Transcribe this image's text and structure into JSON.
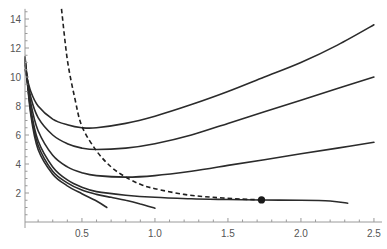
{
  "chart_data": {
    "type": "line",
    "title": "",
    "xlabel": "",
    "ylabel": "",
    "xlim": [
      0.11,
      2.55
    ],
    "ylim": [
      0,
      14.7
    ],
    "grid": false,
    "legend": null,
    "x_ticks": [
      0.5,
      1.0,
      1.5,
      2.0,
      2.5
    ],
    "x_tick_labels": [
      "0.5",
      "1.0",
      "1.5",
      "2.0",
      "2.5"
    ],
    "y_ticks": [
      2,
      4,
      6,
      8,
      10,
      12,
      14
    ],
    "y_tick_labels": [
      "2",
      "4",
      "6",
      "8",
      "10",
      "12",
      "14"
    ],
    "series": [
      {
        "name": "curve-1",
        "style": "solid",
        "points": [
          [
            0.11,
            10.5
          ],
          [
            0.15,
            9.0
          ],
          [
            0.2,
            8.0
          ],
          [
            0.3,
            7.1
          ],
          [
            0.4,
            6.7
          ],
          [
            0.5,
            6.5
          ],
          [
            0.6,
            6.5
          ],
          [
            0.8,
            6.8
          ],
          [
            1.0,
            7.3
          ],
          [
            1.25,
            8.1
          ],
          [
            1.5,
            9.0
          ],
          [
            1.75,
            10.0
          ],
          [
            2.0,
            11.0
          ],
          [
            2.25,
            12.2
          ],
          [
            2.5,
            13.6
          ]
        ]
      },
      {
        "name": "curve-2",
        "style": "solid",
        "points": [
          [
            0.11,
            10.8
          ],
          [
            0.15,
            8.6
          ],
          [
            0.2,
            7.2
          ],
          [
            0.3,
            6.0
          ],
          [
            0.4,
            5.4
          ],
          [
            0.5,
            5.1
          ],
          [
            0.6,
            5.0
          ],
          [
            0.8,
            5.1
          ],
          [
            1.0,
            5.4
          ],
          [
            1.25,
            6.0
          ],
          [
            1.5,
            6.8
          ],
          [
            1.75,
            7.6
          ],
          [
            2.0,
            8.4
          ],
          [
            2.25,
            9.2
          ],
          [
            2.5,
            10.0
          ]
        ]
      },
      {
        "name": "curve-3",
        "style": "solid",
        "points": [
          [
            0.11,
            11.0
          ],
          [
            0.15,
            8.2
          ],
          [
            0.2,
            6.3
          ],
          [
            0.3,
            4.6
          ],
          [
            0.4,
            3.8
          ],
          [
            0.5,
            3.4
          ],
          [
            0.6,
            3.2
          ],
          [
            0.8,
            3.1
          ],
          [
            1.0,
            3.2
          ],
          [
            1.25,
            3.5
          ],
          [
            1.5,
            3.9
          ],
          [
            1.75,
            4.3
          ],
          [
            2.0,
            4.7
          ],
          [
            2.25,
            5.1
          ],
          [
            2.5,
            5.5
          ]
        ]
      },
      {
        "name": "curve-4",
        "style": "solid",
        "points": [
          [
            0.11,
            11.2
          ],
          [
            0.15,
            7.8
          ],
          [
            0.2,
            5.6
          ],
          [
            0.3,
            3.8
          ],
          [
            0.4,
            2.9
          ],
          [
            0.5,
            2.4
          ],
          [
            0.6,
            2.1
          ],
          [
            0.8,
            1.85
          ],
          [
            1.0,
            1.7
          ],
          [
            1.25,
            1.6
          ],
          [
            1.5,
            1.55
          ],
          [
            1.73,
            1.52
          ],
          [
            2.0,
            1.5
          ],
          [
            2.2,
            1.45
          ],
          [
            2.32,
            1.3
          ]
        ]
      },
      {
        "name": "curve-5",
        "style": "solid",
        "points": [
          [
            0.11,
            11.3
          ],
          [
            0.15,
            7.6
          ],
          [
            0.2,
            5.3
          ],
          [
            0.3,
            3.5
          ],
          [
            0.4,
            2.7
          ],
          [
            0.5,
            2.2
          ],
          [
            0.6,
            1.9
          ],
          [
            0.7,
            1.7
          ],
          [
            0.8,
            1.5
          ],
          [
            0.9,
            1.25
          ],
          [
            1.0,
            0.95
          ]
        ]
      },
      {
        "name": "curve-6",
        "style": "solid",
        "points": [
          [
            0.11,
            11.4
          ],
          [
            0.15,
            7.4
          ],
          [
            0.2,
            5.0
          ],
          [
            0.3,
            3.3
          ],
          [
            0.4,
            2.5
          ],
          [
            0.5,
            1.95
          ],
          [
            0.6,
            1.45
          ],
          [
            0.67,
            1.0
          ]
        ]
      },
      {
        "name": "envelope",
        "style": "dashed",
        "points": [
          [
            0.36,
            14.7
          ],
          [
            0.4,
            11.2
          ],
          [
            0.45,
            8.6
          ],
          [
            0.5,
            6.6
          ],
          [
            0.6,
            4.9
          ],
          [
            0.7,
            3.8
          ],
          [
            0.8,
            3.1
          ],
          [
            0.9,
            2.6
          ],
          [
            1.0,
            2.3
          ],
          [
            1.2,
            1.9
          ],
          [
            1.4,
            1.7
          ],
          [
            1.6,
            1.58
          ],
          [
            1.73,
            1.52
          ]
        ]
      }
    ],
    "annotations": [
      {
        "type": "point",
        "x": 1.73,
        "y": 1.52,
        "label": ""
      }
    ]
  }
}
